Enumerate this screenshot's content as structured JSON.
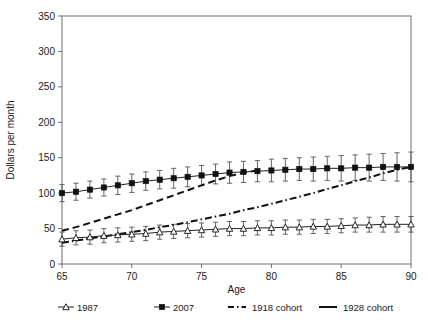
{
  "chart_data": {
    "type": "line",
    "title": "",
    "xlabel": "Age",
    "ylabel": "Dollars per month",
    "xlim": [
      65,
      90
    ],
    "ylim": [
      0,
      350
    ],
    "xticks": [
      65,
      70,
      75,
      80,
      85,
      90
    ],
    "yticks": [
      0,
      50,
      100,
      150,
      200,
      250,
      300,
      350
    ],
    "grid": false,
    "legend_position": "bottom",
    "x": [
      65,
      66,
      67,
      68,
      69,
      70,
      71,
      72,
      73,
      74,
      75,
      76,
      77,
      78,
      79,
      80,
      81,
      82,
      83,
      84,
      85,
      86,
      87,
      88,
      89,
      90
    ],
    "series": [
      {
        "name": "1987",
        "marker": "open-triangle",
        "linestyle": "solid",
        "errorbars": true,
        "values": [
          35,
          37,
          38,
          40,
          41,
          42,
          43,
          45,
          46,
          47,
          48,
          49,
          50,
          50,
          51,
          51,
          52,
          52,
          53,
          53,
          54,
          55,
          55,
          56,
          56,
          56
        ],
        "err_low": [
          10,
          10,
          10,
          10,
          10,
          10,
          10,
          10,
          10,
          10,
          10,
          10,
          10,
          10,
          10,
          10,
          10,
          10,
          10,
          10,
          10,
          10,
          10,
          11,
          11,
          11
        ],
        "err_high": [
          10,
          10,
          10,
          10,
          10,
          10,
          10,
          10,
          10,
          10,
          10,
          10,
          10,
          10,
          10,
          10,
          10,
          10,
          10,
          10,
          10,
          10,
          11,
          11,
          11,
          11
        ]
      },
      {
        "name": "2007",
        "marker": "filled-square",
        "linestyle": "solid",
        "errorbars": true,
        "values": [
          100,
          102,
          105,
          108,
          111,
          114,
          117,
          119,
          121,
          123,
          125,
          127,
          129,
          130,
          131,
          132,
          133,
          134,
          134,
          135,
          135,
          136,
          136,
          137,
          137,
          137
        ],
        "err_low": [
          12,
          12,
          12,
          12,
          13,
          13,
          13,
          13,
          14,
          14,
          14,
          14,
          15,
          15,
          15,
          16,
          16,
          16,
          17,
          17,
          18,
          18,
          19,
          19,
          20,
          21
        ],
        "err_high": [
          12,
          12,
          12,
          12,
          13,
          13,
          13,
          13,
          14,
          14,
          14,
          14,
          15,
          15,
          15,
          16,
          16,
          16,
          17,
          17,
          18,
          18,
          19,
          19,
          20,
          21
        ]
      },
      {
        "name": "1918 cohort",
        "marker": "none",
        "linestyle": "dash-dot",
        "errorbars": false,
        "values": [
          30,
          33,
          36,
          39,
          42,
          45,
          48,
          52,
          55,
          59,
          63,
          67,
          71,
          76,
          80,
          85,
          90,
          95,
          100,
          106,
          111,
          117,
          122,
          128,
          133,
          137
        ]
      },
      {
        "name": "1928 cohort",
        "marker": "none",
        "linestyle": "dashed",
        "errorbars": false,
        "x": [
          65,
          66,
          67,
          68,
          69,
          70,
          71,
          72,
          73,
          74,
          75,
          76,
          77,
          78,
          79
        ],
        "values": [
          47,
          52,
          58,
          64,
          70,
          76,
          83,
          90,
          97,
          104,
          111,
          118,
          124,
          129,
          132
        ]
      }
    ],
    "legend": [
      {
        "label": "1987",
        "style": "line-with-open-triangle"
      },
      {
        "label": "2007",
        "style": "line-with-filled-square"
      },
      {
        "label": "1918 cohort",
        "style": "dash-dot-line"
      },
      {
        "label": "1928 cohort",
        "style": "dashed-line"
      }
    ]
  }
}
